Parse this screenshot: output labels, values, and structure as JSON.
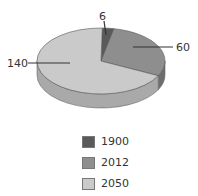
{
  "chart_data": {
    "type": "pie",
    "style": "3d",
    "title": "",
    "slices": [
      {
        "label": "1900",
        "value": 6,
        "color": "#5a5a5a",
        "side_color": "#3e3e3e"
      },
      {
        "label": "2012",
        "value": 60,
        "color": "#8e8e8e",
        "side_color": "#6e6e6e"
      },
      {
        "label": "2050",
        "value": 140,
        "color": "#cacaca",
        "side_color": "#a9a9a9"
      }
    ],
    "data_labels": [
      "6",
      "60",
      "140"
    ],
    "legend": {
      "position": "bottom",
      "entries": [
        "1900",
        "2012",
        "2050"
      ]
    }
  },
  "labels": {
    "s0": "6",
    "s1": "60",
    "s2": "140"
  },
  "legend": {
    "items": [
      {
        "label": "1900",
        "color": "#5a5a5a"
      },
      {
        "label": "2012",
        "color": "#8e8e8e"
      },
      {
        "label": "2050",
        "color": "#cacaca"
      }
    ]
  }
}
